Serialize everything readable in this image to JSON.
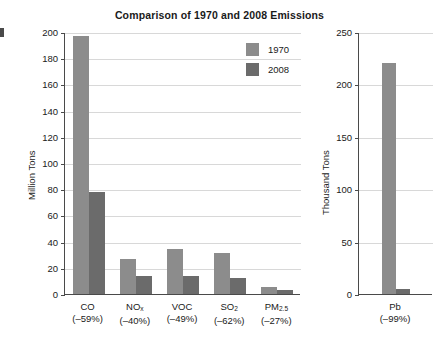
{
  "chart_data": [
    {
      "type": "bar",
      "title": "Comparison of 1970 and 2008 Emissions",
      "panel": "left",
      "xlabel": "",
      "ylabel": "Million Tons",
      "ylim": [
        0,
        200
      ],
      "yticks": [
        0,
        20,
        40,
        60,
        80,
        100,
        120,
        140,
        160,
        180,
        200
      ],
      "grid": true,
      "legend_position": "upper-center-right",
      "categories": [
        "CO",
        "NOx",
        "VOC",
        "SO2",
        "PM2.5"
      ],
      "category_labels": [
        {
          "name": "CO",
          "sub": "",
          "pct": "(–59%)"
        },
        {
          "name": "NO",
          "sub": "x",
          "pct": "(–40%)"
        },
        {
          "name": "VOC",
          "sub": "",
          "pct": "(–49%)"
        },
        {
          "name": "SO",
          "sub": "2",
          "pct": "(–62%)"
        },
        {
          "name": "PM",
          "sub": "2.5",
          "pct": "(–27%)"
        }
      ],
      "series": [
        {
          "name": "1970",
          "color": "#8c8c8c",
          "values": [
            197,
            27,
            34,
            31,
            5
          ]
        },
        {
          "name": "2008",
          "color": "#6b6b6b",
          "values": [
            78,
            14,
            14,
            12,
            3
          ]
        }
      ]
    },
    {
      "type": "bar",
      "title": "",
      "panel": "right",
      "xlabel": "",
      "ylabel": "Thousand Tons",
      "ylim": [
        0,
        250
      ],
      "yticks": [
        0,
        50,
        100,
        150,
        200,
        250
      ],
      "grid": true,
      "categories": [
        "Pb"
      ],
      "category_labels": [
        {
          "name": "Pb",
          "sub": "",
          "pct": "(–99%)"
        }
      ],
      "series": [
        {
          "name": "1970",
          "color": "#8c8c8c",
          "values": [
            220
          ]
        },
        {
          "name": "2008",
          "color": "#6b6b6b",
          "values": [
            5
          ]
        }
      ]
    }
  ],
  "legend": {
    "items": [
      {
        "label": "1970",
        "color": "#8c8c8c"
      },
      {
        "label": "2008",
        "color": "#6b6b6b"
      }
    ]
  },
  "colors": {
    "series_1970": "#8c8c8c",
    "series_2008": "#6b6b6b",
    "axis": "#4a4a4a",
    "gridline": "#d8d8d8",
    "text": "#1a1a1a",
    "background": "#ffffff"
  }
}
